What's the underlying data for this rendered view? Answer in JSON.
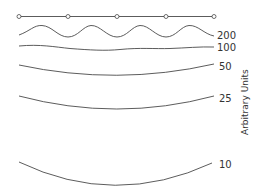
{
  "figure": {
    "axis_label": "Arbitrary Units",
    "node_count": 5,
    "curves": [
      {
        "id": "c200",
        "label": "200",
        "shape": "sinusoidal, 4 periods"
      },
      {
        "id": "c100",
        "label": "100",
        "shape": "slight ripple"
      },
      {
        "id": "c50",
        "label": "50",
        "shape": "shallow sag"
      },
      {
        "id": "c25",
        "label": "25",
        "shape": "moderate sag"
      },
      {
        "id": "c10",
        "label": "10",
        "shape": "deep sag"
      }
    ],
    "colors": {
      "line": "#4a4a4a",
      "text": "#333333",
      "background": "#ffffff"
    }
  }
}
